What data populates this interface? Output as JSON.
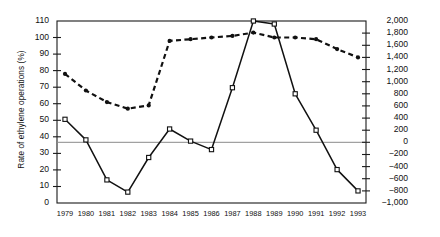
{
  "chart_data": {
    "type": "line",
    "title": "",
    "xlabel": "",
    "grid": false,
    "legend_position": "inline-annotations",
    "categories": [
      "1979",
      "1980",
      "1981",
      "1982",
      "1983",
      "1984",
      "1985",
      "1986",
      "1987",
      "1988",
      "1989",
      "1990",
      "1991",
      "1992",
      "1993"
    ],
    "axes": {
      "left": {
        "label": "Rate of ethylene operations (%)",
        "min": 0,
        "max": 110,
        "step": 10,
        "ticks": [
          "0",
          "10",
          "20",
          "30",
          "40",
          "50",
          "60",
          "70",
          "80",
          "90",
          "100",
          "110"
        ]
      },
      "right": {
        "label": "Operating profits and losses (¥100 million / year)",
        "min": -1000,
        "max": 2000,
        "step": 200,
        "ticks": [
          "2,000",
          "1,800",
          "1,600",
          "1,400",
          "1,200",
          "1,000",
          "800",
          "600",
          "400",
          "200",
          "0",
          "−200",
          "−400",
          "−600",
          "−800",
          "−1,000"
        ]
      }
    },
    "zero_reference_line": 0,
    "series": [
      {
        "name": "Rate of ethylene operations",
        "axis": "left",
        "style": "dashed",
        "marker": "filled-circle",
        "unit": "%",
        "values": [
          78,
          68,
          61,
          57,
          59,
          98,
          99,
          100,
          101,
          103,
          100,
          100,
          99,
          93,
          88
        ]
      },
      {
        "name": "Operating profits and losses",
        "axis": "right",
        "style": "solid",
        "marker": "open-square",
        "unit": "¥100 million / year",
        "values": [
          380,
          40,
          -620,
          -820,
          -250,
          220,
          20,
          -120,
          900,
          2000,
          1950,
          800,
          200,
          -450,
          -800
        ]
      }
    ],
    "annotations": [
      {
        "name": "rate-of-ethylene-operations-label",
        "text": "Rate of ethylene operations"
      },
      {
        "name": "operating-profits-and-losses-label",
        "text": "Operating profits and losses"
      }
    ]
  }
}
